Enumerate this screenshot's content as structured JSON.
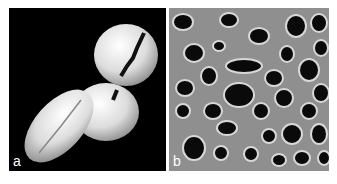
{
  "figure": {
    "panels": [
      {
        "label": "a",
        "description": "SEM image of three pollen grains on black background"
      },
      {
        "label": "b",
        "description": "SEM close-up of perforated grain surface"
      }
    ]
  }
}
